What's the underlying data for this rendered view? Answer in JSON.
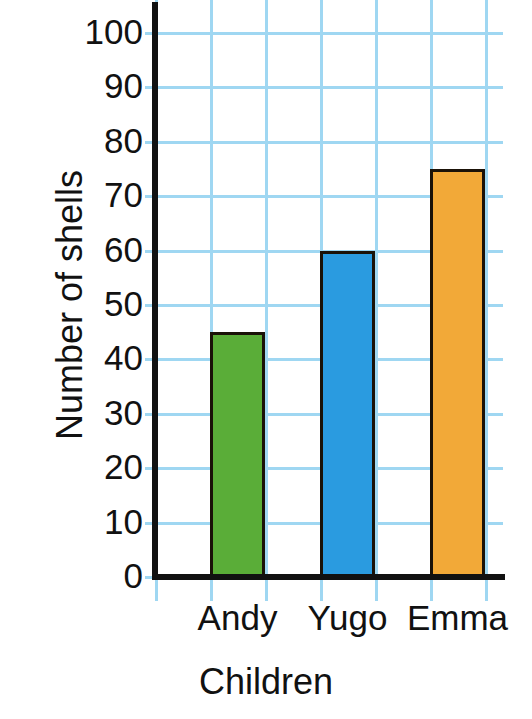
{
  "chart_data": {
    "type": "bar",
    "title": "",
    "categories": [
      "Andy",
      "Yugo",
      "Emma"
    ],
    "values": [
      45,
      60,
      75
    ],
    "series": [
      {
        "name": "Number of shells",
        "values": [
          45,
          60,
          75
        ]
      }
    ],
    "xlabel": "Children",
    "ylabel": "Number of shells",
    "ylim": [
      0,
      100
    ],
    "ytick_step": 10,
    "yticks": [
      0,
      10,
      20,
      30,
      40,
      50,
      60,
      70,
      80,
      90,
      100
    ],
    "ytick_labels": [
      "0",
      "10",
      "20",
      "30",
      "40",
      "50",
      "60",
      "70",
      "80",
      "90",
      "100"
    ],
    "grid": true,
    "grid_color": "#9fd7f2",
    "legend": false,
    "bar_colors": [
      "#5aad38",
      "#2a9be0",
      "#f2a938"
    ],
    "bar_border_color": "#1a1208",
    "axis_color": "#111111",
    "bars": [
      {
        "label": "Andy",
        "value": 45,
        "color": "#5aad38"
      },
      {
        "label": "Yugo",
        "value": 60,
        "color": "#2a9be0"
      },
      {
        "label": "Emma",
        "value": 75,
        "color": "#f2a938"
      }
    ]
  }
}
